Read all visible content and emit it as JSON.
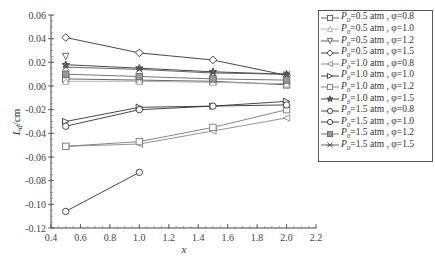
{
  "chart_data": {
    "type": "line",
    "title": "",
    "xlabel": "x",
    "ylabel": "L_d/cm",
    "xlim": [
      0.4,
      2.2
    ],
    "ylim": [
      -0.12,
      0.06
    ],
    "xticks": [
      0.4,
      0.6,
      0.8,
      1.0,
      1.2,
      1.4,
      1.6,
      1.8,
      2.0,
      2.2
    ],
    "yticks": [
      0.06,
      0.04,
      0.02,
      0.0,
      -0.02,
      -0.04,
      -0.06,
      -0.08,
      -0.1,
      -0.12
    ],
    "xtick_labels": [
      "0.4",
      "0.6",
      "0.8",
      "1.0",
      "1.2",
      "1.4",
      "1.6",
      "1.8",
      "2.0",
      "2.2"
    ],
    "ytick_labels": [
      "0.06",
      "0.04",
      "0.02",
      "0.00",
      "-0.02",
      "-0.04",
      "-0.06",
      "-0.08",
      "-0.10",
      "-0.12"
    ],
    "grid": false,
    "legend_position": "right",
    "series": [
      {
        "name": "P0=0.5 atm, φ=0.8",
        "label_p": "P",
        "label_sub": "0",
        "label_rest": "=0.5 atm , φ=0.8",
        "marker": "square",
        "color": "#555555",
        "x": [
          0.5,
          1.0,
          1.5,
          2.0
        ],
        "y": [
          0.006,
          0.005,
          0.004,
          0.001
        ]
      },
      {
        "name": "P0=0.5 atm, φ=1.0",
        "label_p": "P",
        "label_sub": "0",
        "label_rest": "=0.5 atm , φ=1.0",
        "marker": "triangle-up",
        "color": "#aaaaaa",
        "x": [
          0.5,
          1.0,
          1.5,
          2.0
        ],
        "y": [
          0.004,
          0.004,
          0.003,
          0.002
        ]
      },
      {
        "name": "P0=0.5 atm, φ=1.2",
        "label_p": "P",
        "label_sub": "0",
        "label_rest": "=0.5 atm , φ=1.2",
        "marker": "triangle-down",
        "color": "#555555",
        "x": [
          0.5
        ],
        "y": [
          0.025
        ]
      },
      {
        "name": "P0=0.5 atm, φ=1.5",
        "label_p": "P",
        "label_sub": "0",
        "label_rest": "=0.5 atm , φ=1.5",
        "marker": "diamond",
        "color": "#333333",
        "x": [
          0.5,
          1.0,
          1.5,
          2.0
        ],
        "y": [
          0.041,
          0.028,
          0.022,
          0.009
        ]
      },
      {
        "name": "P0=1.0 atm, φ=0.8",
        "label_p": "P",
        "label_sub": "0",
        "label_rest": "=1.0 atm , φ=0.8",
        "marker": "triangle-left",
        "color": "#888888",
        "x": [
          0.5,
          1.0,
          1.5,
          2.0
        ],
        "y": [
          -0.051,
          -0.049,
          -0.038,
          -0.027
        ]
      },
      {
        "name": "P0=1.0 atm, φ=1.0",
        "label_p": "P",
        "label_sub": "0",
        "label_rest": "=1.0 atm , φ=1.0",
        "marker": "triangle-right",
        "color": "#333333",
        "x": [
          0.5,
          1.0,
          1.5,
          2.0
        ],
        "y": [
          -0.03,
          -0.018,
          -0.017,
          -0.013
        ]
      },
      {
        "name": "P0=1.0 atm, φ=1.2",
        "label_p": "P",
        "label_sub": "0",
        "label_rest": "=1.0 atm , φ=1.2",
        "marker": "square",
        "color": "#777777",
        "x": [
          0.5,
          1.0,
          1.5,
          2.0
        ],
        "y": [
          -0.051,
          -0.047,
          -0.035,
          -0.02
        ]
      },
      {
        "name": "P0=1.0 atm, φ=1.5",
        "label_p": "P",
        "label_sub": "0",
        "label_rest": "=1.0 atm , φ=1.5",
        "marker": "star",
        "color": "#333333",
        "x": [
          0.5,
          1.0,
          1.5,
          2.0
        ],
        "y": [
          0.018,
          0.015,
          0.012,
          0.01
        ]
      },
      {
        "name": "P0=1.5 atm, φ=0.8",
        "label_p": "P",
        "label_sub": "0",
        "label_rest": "=1.5 atm , φ=0.8",
        "marker": "circle",
        "color": "#333333",
        "x": [
          0.5,
          1.0
        ],
        "y": [
          -0.106,
          -0.073
        ]
      },
      {
        "name": "P0=1.5 atm, φ=1.0",
        "label_p": "P",
        "label_sub": "0",
        "label_rest": "=1.5 atm , φ=1.0",
        "marker": "circle",
        "color": "#333333",
        "x": [
          0.5,
          1.0,
          1.5,
          2.0
        ],
        "y": [
          -0.034,
          -0.02,
          -0.017,
          -0.016
        ]
      },
      {
        "name": "P0=1.5 atm, φ=1.2",
        "label_p": "P",
        "label_sub": "0",
        "label_rest": "=1.5 atm , φ=1.2",
        "marker": "square-filled",
        "color": "#666666",
        "x": [
          0.5,
          1.0,
          1.5,
          2.0
        ],
        "y": [
          0.01,
          0.008,
          0.006,
          0.005
        ]
      },
      {
        "name": "P0=1.5 atm, φ=1.5",
        "label_p": "P",
        "label_sub": "0",
        "label_rest": "=1.5 atm , φ=1.5",
        "marker": "x",
        "color": "#555555",
        "x": [
          0.5,
          1.0,
          1.5,
          2.0
        ],
        "y": [
          0.016,
          0.014,
          0.011,
          0.01
        ]
      }
    ]
  }
}
